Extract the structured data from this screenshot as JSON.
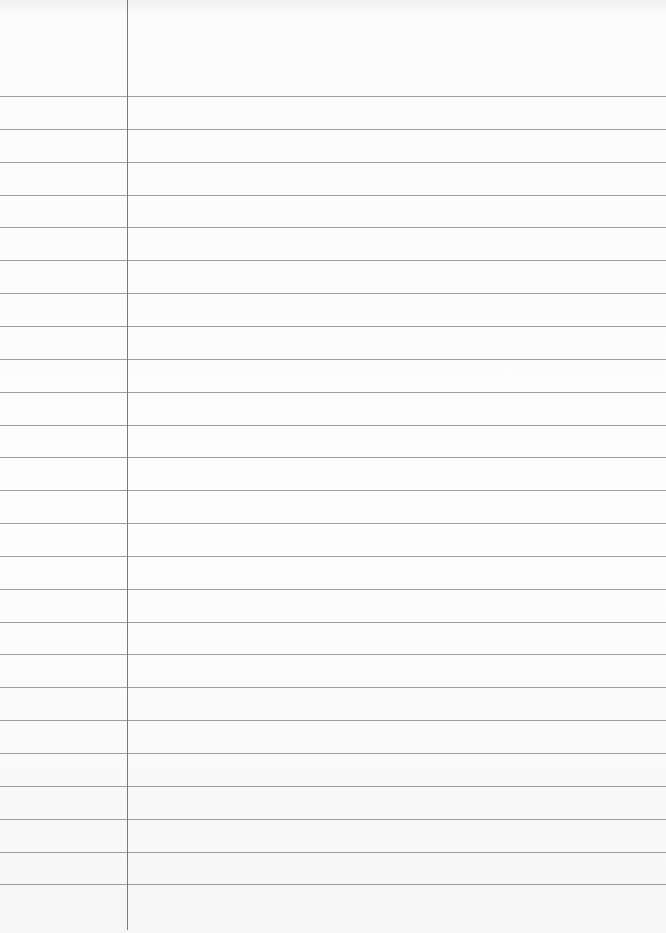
{
  "paper": {
    "kind": "lined-paper",
    "background_color": "#fbfbfb",
    "line_color": "#8d8d8d",
    "margin_line_color": "#7a7a7a",
    "margin_x": 127,
    "first_line_y": 96,
    "line_spacing": 32.85,
    "line_count": 25
  }
}
